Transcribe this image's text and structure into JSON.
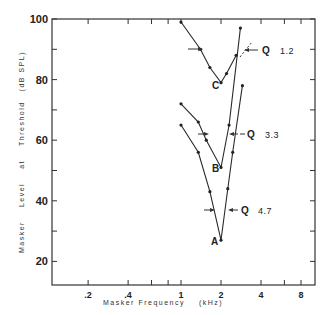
{
  "chart_data": {
    "type": "line",
    "title": "",
    "xlabel": "Masker Frequency (kHz)",
    "ylabel": "Masker Level at Threshold (dB SPL)",
    "xscale": "log2",
    "xlim": [
      0.1,
      10
    ],
    "ylim": [
      15,
      100
    ],
    "x_ticks": [
      0.2,
      0.4,
      1,
      2,
      4,
      8
    ],
    "x_tick_labels": [
      ".2",
      ".4",
      "1",
      "2",
      "4",
      "8"
    ],
    "y_ticks": [
      20,
      40,
      60,
      80,
      100
    ],
    "y_tick_labels": [
      "20",
      "40",
      "60",
      "80",
      "100"
    ],
    "grid": false,
    "legend": "none",
    "series": [
      {
        "name": "C",
        "q_label": "Q",
        "q_value": "1.2",
        "x": [
          1.0,
          1.4,
          1.65,
          2.0,
          2.2,
          2.6
        ],
        "y": [
          99,
          90,
          84,
          79,
          82,
          88
        ]
      },
      {
        "name": "B",
        "q_label": "Q",
        "q_value": "3.3",
        "x": [
          1.0,
          1.35,
          1.55,
          2.0,
          2.3,
          2.8
        ],
        "y": [
          72,
          66,
          60,
          51,
          65,
          97
        ]
      },
      {
        "name": "A",
        "q_label": "Q",
        "q_value": "4.7",
        "x": [
          1.0,
          1.35,
          1.65,
          2.0,
          2.25,
          2.45,
          2.9
        ],
        "y": [
          65,
          56,
          43,
          27,
          44,
          56,
          78
        ]
      }
    ],
    "annotations": [
      {
        "text": "C",
        "x": 2.0,
        "y": 79
      },
      {
        "text": "B",
        "x": 2.0,
        "y": 51
      },
      {
        "text": "A",
        "x": 2.0,
        "y": 27
      },
      {
        "text": "Q 1.2",
        "x": 3.0,
        "y": 89
      },
      {
        "text": "Q 3.3",
        "x": 3.0,
        "y": 62
      },
      {
        "text": "Q 4.7",
        "x": 3.0,
        "y": 37
      }
    ]
  },
  "labels": {
    "y_axis": [
      "Masker",
      "Level",
      "at",
      "Threshold",
      "(dB SPL)"
    ],
    "x_axis": "Masker Frequency",
    "x_units": "(kHz)",
    "curve_c": "C",
    "curve_b": "B",
    "curve_a": "A",
    "q": "Q",
    "q_c": "1.2",
    "q_b": "3.3",
    "q_a": "4.7"
  }
}
